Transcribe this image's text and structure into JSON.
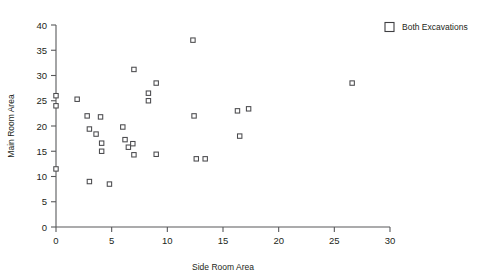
{
  "chart_data": {
    "type": "scatter",
    "title": "",
    "xlabel": "Side Room Area",
    "ylabel": "Main Room Area",
    "xlim": [
      0,
      30
    ],
    "ylim": [
      0,
      40
    ],
    "xticks": [
      0,
      5,
      10,
      15,
      20,
      25,
      30
    ],
    "yticks": [
      0,
      5,
      10,
      15,
      20,
      25,
      30,
      35,
      40
    ],
    "xtick_labels": [
      "0",
      "5",
      "10",
      "15",
      "20",
      "25",
      "30"
    ],
    "ytick_labels": [
      "0",
      "5",
      "10",
      "15",
      "20",
      "25",
      "30",
      "35",
      "40"
    ],
    "grid": false,
    "legend_position": "top-right",
    "marker_style": "open-square",
    "series": [
      {
        "name": "Both Excavations",
        "marker": "open-square",
        "color": "#4a4a4d",
        "points": [
          [
            0.0,
            26.0
          ],
          [
            0.0,
            24.0
          ],
          [
            0.0,
            11.5
          ],
          [
            1.9,
            25.3
          ],
          [
            2.8,
            22.0
          ],
          [
            3.0,
            19.4
          ],
          [
            3.0,
            9.0
          ],
          [
            3.6,
            18.4
          ],
          [
            4.0,
            21.8
          ],
          [
            4.1,
            16.6
          ],
          [
            4.1,
            15.0
          ],
          [
            4.8,
            8.5
          ],
          [
            6.0,
            19.8
          ],
          [
            6.2,
            17.3
          ],
          [
            6.5,
            15.8
          ],
          [
            6.9,
            16.5
          ],
          [
            7.0,
            31.2
          ],
          [
            7.0,
            14.3
          ],
          [
            8.3,
            26.5
          ],
          [
            8.3,
            25.0
          ],
          [
            9.0,
            28.5
          ],
          [
            9.0,
            14.4
          ],
          [
            12.3,
            37.0
          ],
          [
            12.4,
            22.0
          ],
          [
            12.6,
            13.5
          ],
          [
            13.4,
            13.5
          ],
          [
            16.3,
            23.0
          ],
          [
            16.5,
            18.0
          ],
          [
            17.3,
            23.4
          ],
          [
            26.6,
            28.5
          ]
        ]
      }
    ]
  },
  "legend": {
    "entries": [
      {
        "label": "Both Excavations",
        "marker": "open-square"
      }
    ]
  },
  "axes": {
    "x_title": "Side Room Area",
    "y_title": "Main Room Area"
  }
}
